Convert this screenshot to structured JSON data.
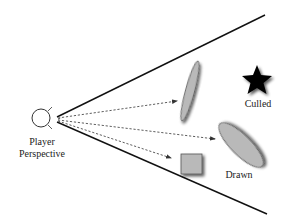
{
  "labels": {
    "player_line1": "Player",
    "player_line2": "Perspective",
    "culled": "Culled",
    "drawn": "Drawn"
  },
  "colors": {
    "background": "#ffffff",
    "frustum_lines": "#111111",
    "arrows": "#333333",
    "drawn_objects_fill": "#b9b9b9",
    "culled_object_fill": "#000000",
    "shadow": "#555555"
  },
  "objects": [
    {
      "name": "thin-ellipse",
      "status": "drawn"
    },
    {
      "name": "large-ellipse",
      "status": "drawn"
    },
    {
      "name": "square",
      "status": "drawn"
    },
    {
      "name": "star",
      "status": "culled"
    }
  ]
}
